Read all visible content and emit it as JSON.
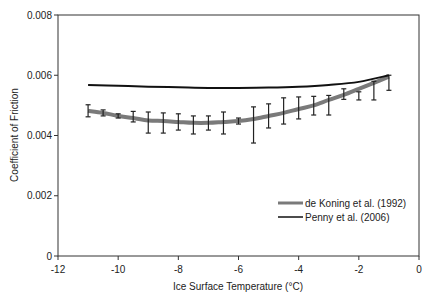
{
  "chart_data": {
    "type": "line",
    "title": "",
    "xlabel": "Ice Surface Temperature (°C)",
    "ylabel": "Coefficient of Friction",
    "xlim": [
      -12,
      0
    ],
    "ylim": [
      0,
      0.008
    ],
    "x_ticks": [
      -12,
      -10,
      -8,
      -6,
      -4,
      -2,
      0
    ],
    "x_tick_labels": [
      "-12",
      "-10",
      "-8",
      "-6",
      "-4",
      "-2",
      "0"
    ],
    "y_ticks": [
      0,
      0.002,
      0.004,
      0.006,
      0.008
    ],
    "y_tick_labels": [
      "0",
      "0.002",
      "0.004",
      "0.006",
      "0.008"
    ],
    "grid": false,
    "legend_position": "lower right inside",
    "series": [
      {
        "name": "de Koning et al. (1992)",
        "color": "#7a7a7a",
        "line_width": 4,
        "x": [
          -11,
          -10.5,
          -10,
          -9.5,
          -9,
          -8.5,
          -8,
          -7.5,
          -7,
          -6.5,
          -6,
          -5.5,
          -5,
          -4.5,
          -4,
          -3.5,
          -3,
          -2.5,
          -2,
          -1.5,
          -1
        ],
        "values": [
          0.00482,
          0.00475,
          0.00465,
          0.00458,
          0.0045,
          0.00448,
          0.00445,
          0.00442,
          0.00442,
          0.00445,
          0.00448,
          0.00455,
          0.00465,
          0.00475,
          0.00488,
          0.005,
          0.00518,
          0.00535,
          0.00555,
          0.00575,
          0.00595
        ],
        "error_upper": [
          0.00502,
          0.00485,
          0.00472,
          0.0048,
          0.00478,
          0.00475,
          0.00472,
          0.00465,
          0.00465,
          0.00478,
          0.00458,
          0.00495,
          0.00505,
          0.00525,
          0.00528,
          0.0053,
          0.00533,
          0.00555,
          0.00545,
          0.0058,
          0.006
        ],
        "error_lower": [
          0.00462,
          0.00465,
          0.00458,
          0.00445,
          0.00408,
          0.00408,
          0.00418,
          0.00405,
          0.00418,
          0.00405,
          0.00438,
          0.00375,
          0.00425,
          0.00438,
          0.00455,
          0.00468,
          0.00468,
          0.0052,
          0.00518,
          0.00518,
          0.0055
        ]
      },
      {
        "name": "Penny et al. (2006)",
        "color": "#111111",
        "line_width": 2,
        "x": [
          -11,
          -10,
          -9,
          -8,
          -7,
          -6,
          -5,
          -4,
          -3,
          -2,
          -1
        ],
        "values": [
          0.00568,
          0.00565,
          0.00562,
          0.0056,
          0.00558,
          0.00558,
          0.00559,
          0.00562,
          0.00568,
          0.00578,
          0.006
        ]
      }
    ]
  }
}
